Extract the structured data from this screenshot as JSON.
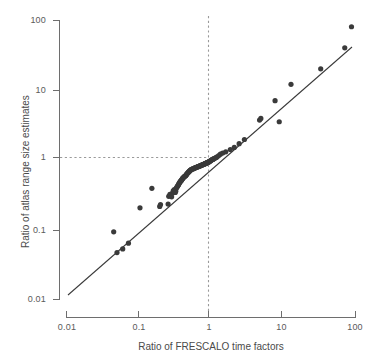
{
  "figure": {
    "background_color": "#ffffff",
    "point_color": "#3a3a3a",
    "line_color": "#3a3a3a",
    "guide_color": "#9a9a9a",
    "axis_color": "#6e6e6e",
    "text_color": "#4a4a4a"
  },
  "chart_data": {
    "type": "scatter",
    "title": "",
    "subtitle": "",
    "xlabel": "Ratio of FRESCALO time factors",
    "ylabel": "Ratio of atlas range size estimates",
    "xscale": "log",
    "yscale": "log",
    "xlim": [
      0.01,
      100
    ],
    "ylim": [
      0.01,
      100
    ],
    "xticks": [
      0.01,
      0.1,
      1,
      10,
      100
    ],
    "yticks": [
      0.01,
      0.1,
      1,
      10,
      100
    ],
    "xticklabels": [
      "0.01",
      "0.1",
      "1",
      "10",
      "100"
    ],
    "yticklabels": [
      "0.01",
      "0.1",
      "1",
      "10",
      "100"
    ],
    "grid": false,
    "legend": null,
    "annotations": [
      {
        "name": "vertical-reference-line",
        "type": "vline",
        "x": 1,
        "style": "dashed",
        "color": "#9a9a9a"
      },
      {
        "name": "horizontal-reference-line",
        "type": "hline",
        "y": 1,
        "x_from": 0.01,
        "x_to": 1,
        "style": "dashed",
        "color": "#9a9a9a"
      },
      {
        "name": "fitted-regression-line",
        "type": "line",
        "x_from": 0.0135,
        "y_from": 0.0185,
        "x_to": 93.0,
        "y_to": 46.0,
        "style": "solid",
        "color": "#3a3a3a"
      }
    ],
    "series": [
      {
        "name": "species",
        "marker": "filled-circle",
        "color": "#3a3a3a",
        "n_points": 118,
        "x": [
          0.045,
          0.05,
          0.06,
          0.072,
          0.104,
          0.152,
          0.195,
          0.2,
          0.255,
          0.26,
          0.27,
          0.285,
          0.295,
          0.3,
          0.31,
          0.32,
          0.325,
          0.33,
          0.335,
          0.34,
          0.345,
          0.35,
          0.355,
          0.36,
          0.365,
          0.37,
          0.375,
          0.38,
          0.385,
          0.39,
          0.395,
          0.4,
          0.405,
          0.41,
          0.42,
          0.425,
          0.43,
          0.44,
          0.445,
          0.45,
          0.455,
          0.46,
          0.465,
          0.47,
          0.48,
          0.485,
          0.49,
          0.5,
          0.505,
          0.51,
          0.52,
          0.53,
          0.54,
          0.55,
          0.56,
          0.57,
          0.58,
          0.59,
          0.6,
          0.61,
          0.62,
          0.63,
          0.64,
          0.65,
          0.66,
          0.67,
          0.68,
          0.69,
          0.7,
          0.71,
          0.72,
          0.73,
          0.74,
          0.75,
          0.76,
          0.77,
          0.78,
          0.79,
          0.8,
          0.81,
          0.82,
          0.83,
          0.84,
          0.85,
          0.86,
          0.87,
          0.88,
          0.89,
          0.9,
          0.91,
          0.92,
          0.93,
          0.945,
          0.96,
          0.975,
          0.99,
          1.0,
          1.01,
          1.03,
          1.05,
          1.07,
          1.09,
          1.11,
          1.14,
          1.18,
          1.22,
          1.28,
          1.35,
          1.45,
          1.6,
          1.85,
          2.1,
          2.45,
          2.9,
          4.7,
          4.9,
          7.7,
          8.8,
          12.8,
          33.0,
          71.0,
          88.0
        ],
        "y": [
          0.093,
          0.047,
          0.053,
          0.064,
          0.205,
          0.39,
          0.215,
          0.228,
          0.232,
          0.3,
          0.32,
          0.295,
          0.335,
          0.36,
          0.375,
          0.34,
          0.355,
          0.39,
          0.4,
          0.41,
          0.42,
          0.43,
          0.44,
          0.455,
          0.465,
          0.475,
          0.485,
          0.495,
          0.5,
          0.51,
          0.52,
          0.53,
          0.54,
          0.55,
          0.56,
          0.57,
          0.58,
          0.585,
          0.59,
          0.6,
          0.61,
          0.62,
          0.63,
          0.64,
          0.65,
          0.66,
          0.67,
          0.68,
          0.69,
          0.7,
          0.71,
          0.72,
          0.73,
          0.735,
          0.74,
          0.745,
          0.75,
          0.76,
          0.765,
          0.77,
          0.775,
          0.78,
          0.785,
          0.79,
          0.795,
          0.8,
          0.805,
          0.81,
          0.815,
          0.82,
          0.825,
          0.83,
          0.835,
          0.84,
          0.845,
          0.85,
          0.855,
          0.86,
          0.865,
          0.87,
          0.875,
          0.88,
          0.885,
          0.89,
          0.895,
          0.9,
          0.905,
          0.91,
          0.915,
          0.92,
          0.925,
          0.93,
          0.94,
          0.95,
          0.96,
          0.97,
          0.98,
          0.99,
          1.0,
          1.01,
          1.02,
          1.03,
          1.04,
          1.06,
          1.08,
          1.1,
          1.15,
          1.2,
          1.25,
          1.3,
          1.4,
          1.5,
          1.7,
          1.95,
          3.7,
          3.9,
          7.0,
          3.5,
          12.0,
          20.0,
          40.0,
          80.0
        ],
        "outlier_notes": [
          {
            "x": 0.152,
            "y": 0.39,
            "note": "above-line"
          },
          {
            "x": 0.104,
            "y": 0.205,
            "note": "above-line"
          },
          {
            "x": 8.8,
            "y": 3.5,
            "note": "below-line"
          },
          {
            "x": 88.0,
            "y": 80.0,
            "note": "above-line-top-right"
          }
        ]
      }
    ]
  },
  "axes": {
    "x_title": "Ratio of FRESCALO time factors",
    "y_title": "Ratio of atlas range size estimates",
    "x_labels": [
      "0.01",
      "0.1",
      "1",
      "10",
      "100"
    ],
    "y_labels": [
      "100",
      "10",
      "1",
      "0.1",
      "0.01"
    ]
  }
}
